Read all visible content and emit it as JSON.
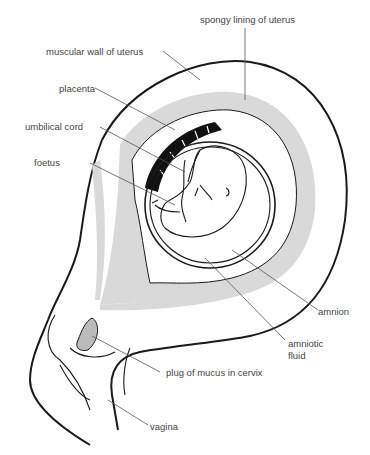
{
  "diagram": {
    "colors": {
      "outline": "#1a1a1a",
      "lining_fill": "#d9d9d9",
      "placenta_fill": "#111111",
      "label_text": "#444444",
      "background": "#ffffff"
    },
    "labels": {
      "spongy_lining": "spongy lining of uterus",
      "muscular_wall": "muscular wall of uterus",
      "placenta": "placenta",
      "umbilical_cord": "umbilical cord",
      "foetus": "foetus",
      "amnion": "amnion",
      "amniotic_fluid_line1": "amniotic",
      "amniotic_fluid_line2": "fluid",
      "plug_of_mucus": "plug of mucus in cervix",
      "vagina": "vagina"
    }
  }
}
